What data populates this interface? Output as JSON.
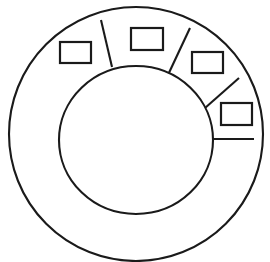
{
  "diagram": {
    "type": "line-art-schematic",
    "style": {
      "stroke_color": "#1a1a1a",
      "fill_color": "#ffffff",
      "background_color": "#ffffff",
      "stroke_width": 2.1
    },
    "canvas": {
      "width": 270,
      "height": 262
    },
    "outer_ring": {
      "label": "outer-ring",
      "center_x": 136,
      "center_y": 134,
      "radius_x": 127,
      "radius_y": 127
    },
    "inner_circle": {
      "label": "inner-circle",
      "center_x": 136,
      "center_y": 140,
      "radius_x": 77,
      "radius_y": 74
    },
    "callouts": [
      {
        "id": "callout-1",
        "label": "",
        "box": {
          "x": 60,
          "y": 42,
          "width": 31,
          "height": 21
        },
        "leader": {
          "x1": 101,
          "y1": 20,
          "x2": 112,
          "y2": 67
        }
      },
      {
        "id": "callout-2",
        "label": "",
        "box": {
          "x": 131,
          "y": 28,
          "width": 32,
          "height": 22
        },
        "leader": {
          "x1": 190,
          "y1": 28,
          "x2": 167,
          "y2": 77
        }
      },
      {
        "id": "callout-3",
        "label": "",
        "box": {
          "x": 192,
          "y": 52,
          "width": 31,
          "height": 21
        },
        "leader": {
          "x1": 239,
          "y1": 78,
          "x2": 205,
          "y2": 108
        }
      },
      {
        "id": "callout-4",
        "label": "",
        "box": {
          "x": 221,
          "y": 103,
          "width": 31,
          "height": 22
        },
        "leader": {
          "x1": 254,
          "y1": 139,
          "x2": 213,
          "y2": 139
        }
      }
    ]
  }
}
